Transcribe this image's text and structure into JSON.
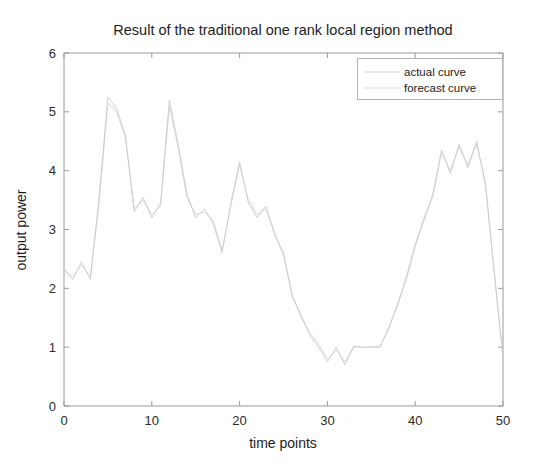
{
  "chart_data": {
    "type": "line",
    "title": "Result of the traditional one rank local region method",
    "xlabel": "time points",
    "ylabel": "output power",
    "xlim": [
      0,
      50
    ],
    "ylim": [
      0,
      6
    ],
    "xticks": [
      0,
      10,
      20,
      30,
      40,
      50
    ],
    "yticks": [
      0,
      1,
      2,
      3,
      4,
      5,
      6
    ],
    "grid": false,
    "legend_position": "upper-right",
    "legend": [
      "actual curve",
      "forecast curve"
    ],
    "colors": {
      "actual": "#c9c9cc",
      "forecast": "#d2d2d6",
      "axis": "#9a9a9a",
      "text": "#1c1c1c",
      "background": "#ffffff"
    },
    "x": [
      0,
      1,
      2,
      3,
      4,
      5,
      6,
      7,
      8,
      9,
      10,
      11,
      12,
      13,
      14,
      15,
      16,
      17,
      18,
      19,
      20,
      21,
      22,
      23,
      24,
      25,
      26,
      27,
      28,
      29,
      30,
      31,
      32,
      33,
      34,
      35,
      36,
      37,
      38,
      39,
      40,
      41,
      42,
      43,
      44,
      45,
      46,
      47,
      48,
      49,
      50
    ],
    "series": [
      {
        "name": "actual curve",
        "values": [
          2.35,
          2.15,
          2.45,
          2.15,
          3.55,
          5.25,
          5.05,
          4.6,
          3.3,
          3.55,
          3.2,
          3.45,
          5.2,
          4.45,
          3.6,
          3.2,
          3.35,
          3.1,
          2.6,
          3.45,
          4.15,
          3.45,
          3.2,
          3.4,
          2.9,
          2.6,
          1.85,
          1.55,
          1.2,
          1.0,
          0.75,
          1.0,
          0.7,
          1.0,
          1.0,
          1.0,
          1.0,
          1.35,
          1.7,
          2.2,
          2.75,
          3.15,
          3.6,
          4.35,
          3.95,
          4.45,
          4.05,
          4.5,
          3.75,
          2.3,
          0.8
        ]
      },
      {
        "name": "forecast curve",
        "values": [
          2.3,
          2.2,
          2.4,
          2.2,
          3.45,
          5.15,
          5.0,
          4.55,
          3.35,
          3.5,
          3.25,
          3.4,
          5.1,
          4.4,
          3.55,
          3.25,
          3.3,
          3.15,
          2.65,
          3.4,
          4.1,
          3.5,
          3.25,
          3.35,
          2.95,
          2.55,
          1.9,
          1.5,
          1.25,
          1.05,
          0.8,
          0.95,
          0.75,
          1.02,
          1.0,
          1.0,
          1.02,
          1.3,
          1.75,
          2.15,
          2.7,
          3.2,
          3.55,
          4.3,
          4.0,
          4.4,
          4.1,
          4.45,
          3.8,
          2.25,
          0.85
        ]
      }
    ]
  },
  "figure": {
    "plot_left": 64,
    "plot_right": 503,
    "plot_top": 53,
    "plot_bottom": 406
  }
}
